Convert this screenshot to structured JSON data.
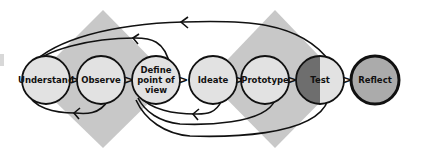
{
  "diagram": {
    "type": "design-thinking-process",
    "colors": {
      "diamond": "#c8c8c8",
      "node_fill": "#e2e2e2",
      "test_dark": "#6e6e6e",
      "test_light": "#e2e2e2",
      "reflect_fill": "#ababab",
      "stroke": "#111111"
    },
    "nodes": [
      {
        "id": "understand",
        "label": "Understand",
        "lines": [
          "Understand"
        ]
      },
      {
        "id": "observe",
        "label": "Observe",
        "lines": [
          "Observe"
        ]
      },
      {
        "id": "define",
        "label": "Define point of view",
        "lines": [
          "Define",
          "point of",
          "view"
        ]
      },
      {
        "id": "ideate",
        "label": "Ideate",
        "lines": [
          "Ideate"
        ]
      },
      {
        "id": "prototype",
        "label": "Prototype",
        "lines": [
          "Prototype"
        ]
      },
      {
        "id": "test",
        "label": "Test",
        "lines": [
          "Test"
        ]
      },
      {
        "id": "reflect",
        "label": "Reflect",
        "lines": [
          "Reflect"
        ]
      }
    ],
    "connector_glyph": ">",
    "feedback_loops": [
      {
        "from": "test",
        "to": "understand",
        "position": "top"
      },
      {
        "from": "define",
        "to": "understand",
        "position": "top"
      },
      {
        "from": "observe",
        "to": "understand",
        "position": "bottom"
      },
      {
        "from": "ideate",
        "to": "define",
        "position": "bottom"
      },
      {
        "from": "prototype",
        "to": "define",
        "position": "bottom"
      },
      {
        "from": "test",
        "to": "define",
        "position": "bottom"
      }
    ]
  }
}
